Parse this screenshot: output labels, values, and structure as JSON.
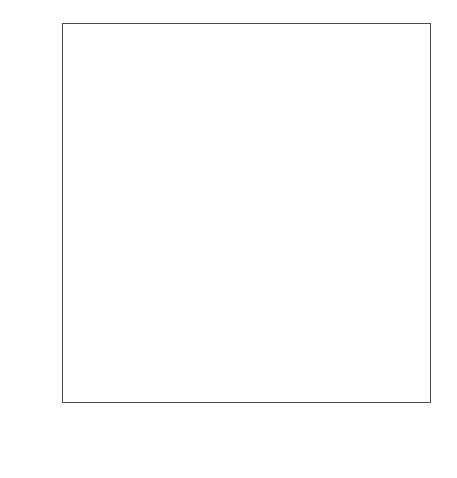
{
  "chart_data": {
    "type": "scatter",
    "title": "",
    "subtitle": "",
    "xlabel": "Normal Percentiles",
    "ylabel": "RESIDUAL",
    "ylabel_letters": [
      "R",
      "E",
      "S",
      "I",
      "D",
      "U",
      "A",
      "L"
    ],
    "x_tick_labels": [
      "1",
      "5",
      "10",
      "25",
      "50",
      "75",
      "90",
      "95",
      "99"
    ],
    "x_tick_values": [
      1,
      5,
      10,
      25,
      50,
      75,
      90,
      95,
      99
    ],
    "x_tick_px": [
      70,
      122,
      154,
      197,
      253,
      303,
      348,
      380,
      428
    ],
    "y_tick_labels": [
      "30",
      "20",
      "10",
      "0",
      "-10",
      "-20",
      "-30"
    ],
    "y_tick_values": [
      30,
      20,
      10,
      0,
      -10,
      -20,
      -30
    ],
    "ylim": [
      -32.5,
      32.5
    ],
    "xlim_percentile": [
      0.5,
      99.5
    ],
    "grid": false,
    "legend": "none",
    "marker": "plus",
    "marker_color": "#111111",
    "frame_color": "#4a4a4a",
    "background": "#ffffff",
    "n_points": 40,
    "points": [
      {
        "percentile": 2.0,
        "residual": -22.4
      },
      {
        "percentile": 5.2,
        "residual": -14.9
      },
      {
        "percentile": 8.3,
        "residual": -12.4
      },
      {
        "percentile": 10.8,
        "residual": -10.0
      },
      {
        "percentile": 13.5,
        "residual": -10.0
      },
      {
        "percentile": 16.0,
        "residual": -7.5
      },
      {
        "percentile": 17.8,
        "residual": -7.5
      },
      {
        "percentile": 22.5,
        "residual": -7.5
      },
      {
        "percentile": 24.6,
        "residual": -7.5
      },
      {
        "percentile": 28.2,
        "residual": -5.0
      },
      {
        "percentile": 30.4,
        "residual": -5.0
      },
      {
        "percentile": 32.4,
        "residual": -5.0
      },
      {
        "percentile": 34.5,
        "residual": -5.0
      },
      {
        "percentile": 36.7,
        "residual": -5.0
      },
      {
        "percentile": 39.2,
        "residual": -5.0
      },
      {
        "percentile": 42.4,
        "residual": -2.5
      },
      {
        "percentile": 44.7,
        "residual": -2.5
      },
      {
        "percentile": 47.5,
        "residual": -2.5
      },
      {
        "percentile": 51.5,
        "residual": 0.0
      },
      {
        "percentile": 54.0,
        "residual": 2.5
      },
      {
        "percentile": 55.8,
        "residual": 2.5
      },
      {
        "percentile": 58.3,
        "residual": 2.5
      },
      {
        "percentile": 63.2,
        "residual": 5.0
      },
      {
        "percentile": 65.3,
        "residual": 5.0
      },
      {
        "percentile": 67.5,
        "residual": 5.0
      },
      {
        "percentile": 72.8,
        "residual": 7.5
      },
      {
        "percentile": 75.0,
        "residual": 7.5
      },
      {
        "percentile": 77.2,
        "residual": 7.5
      },
      {
        "percentile": 84.5,
        "residual": 10.0
      },
      {
        "percentile": 86.0,
        "residual": 10.0
      },
      {
        "percentile": 88.4,
        "residual": 12.5
      },
      {
        "percentile": 90.4,
        "residual": 12.5
      },
      {
        "percentile": 93.0,
        "residual": 15.0
      },
      {
        "percentile": 95.2,
        "residual": 15.0
      },
      {
        "percentile": 97.8,
        "residual": 19.8
      }
    ]
  }
}
